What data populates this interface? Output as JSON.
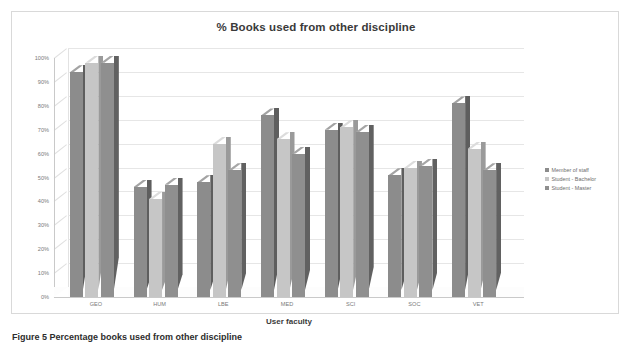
{
  "figure": {
    "caption": "Figure 5 Percentage books used from other discipline"
  },
  "chart_data": {
    "type": "bar",
    "title": "% Books used from other discipline",
    "xlabel": "User faculty",
    "ylabel": "",
    "ylim": [
      0,
      100
    ],
    "grid": true,
    "legend_position": "right",
    "style": "3d-clustered-column",
    "categories": [
      "GEO",
      "HUM",
      "LBE",
      "MED",
      "SCI",
      "SOC",
      "VET"
    ],
    "ytick_labels": [
      "0%",
      "10%",
      "20%",
      "30%",
      "40%",
      "50%",
      "60%",
      "70%",
      "80%",
      "90%",
      "100%"
    ],
    "ytick_values": [
      0,
      10,
      20,
      30,
      40,
      50,
      60,
      70,
      80,
      90,
      100
    ],
    "series": [
      {
        "name": "Member of staff",
        "color": "#8c8c8c",
        "values": [
          94,
          46,
          48,
          76,
          70,
          51,
          81
        ]
      },
      {
        "name": "Student - Bachelor",
        "color": "#c6c6c6",
        "values": [
          98,
          41,
          64,
          66,
          71,
          54,
          62
        ]
      },
      {
        "name": "Student - Master",
        "color": "#8f8f8f",
        "values": [
          98,
          47,
          53,
          60,
          69,
          55,
          53
        ]
      }
    ]
  }
}
